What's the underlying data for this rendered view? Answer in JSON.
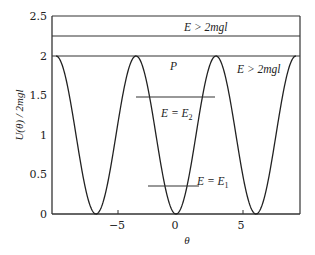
{
  "chart_data": {
    "type": "line",
    "title": "",
    "xlabel": "θ",
    "ylabel": "U(θ) / 2mgl",
    "xlim": [
      -9.42,
      9.42
    ],
    "ylim": [
      0,
      2.5
    ],
    "xticks": [
      -5,
      0,
      5
    ],
    "xtick_labels": [
      "−5",
      "0",
      "5"
    ],
    "yticks": [
      0,
      0.5,
      1,
      1.5,
      2,
      2.5
    ],
    "ytick_labels": [
      "0",
      "0.5",
      "1",
      "1.5",
      "2",
      "2.5"
    ],
    "grid": false,
    "legend": null,
    "series": [
      {
        "name": "U(θ)/2mgl = 1 − cos θ",
        "function": "1 - cos(theta)",
        "x": [
          -9.42,
          -7.85,
          -6.28,
          -4.71,
          -3.14,
          -1.57,
          0,
          1.57,
          3.14,
          4.71,
          6.28,
          7.85,
          9.42
        ],
        "values": [
          2,
          1,
          0,
          1,
          2,
          1,
          0,
          1,
          2,
          1,
          0,
          1,
          2
        ]
      }
    ],
    "energy_levels": [
      {
        "label": "E > 2mgl",
        "y": 2.25,
        "x_range": [
          -9.42,
          9.42
        ]
      },
      {
        "label": "E = E₂",
        "y": 1.48,
        "x_range": [
          -2.3,
          3.1
        ]
      },
      {
        "label": "E = E₁",
        "y": 0.35,
        "x_range": [
          -2.2,
          1.8
        ]
      }
    ],
    "annotations": [
      {
        "text": "E > 2mgl",
        "x": 0.3,
        "y": 2.38
      },
      {
        "text": "P",
        "x": 0,
        "y": 1.88
      },
      {
        "text": "E > 2mgl",
        "x": 6.8,
        "y": 1.88
      },
      {
        "text": "E = E₂",
        "x": 1.1,
        "y": 1.25
      },
      {
        "text": "E = E₁",
        "x": 2.0,
        "y": 0.4
      }
    ]
  },
  "labels": {
    "xlabel": "θ",
    "ylabel": "U(θ) / 2mgl",
    "ann_top": "E > 2mgl",
    "ann_p": "P",
    "ann_right": "E > 2mgl",
    "ann_e2_prefix": "E = E",
    "ann_e2_sub": "2",
    "ann_e1_prefix": "E = E",
    "ann_e1_sub": "1"
  }
}
